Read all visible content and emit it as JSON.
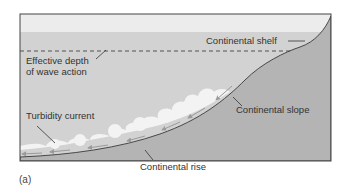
{
  "figure": {
    "caption": "(a)",
    "labels": {
      "continental_shelf": "Continental shelf",
      "effective_depth_line1": "Effective depth",
      "effective_depth_line2": "of wave action",
      "turbidity_current": "Turbidity current",
      "continental_slope": "Continental slope",
      "continental_rise": "Continental rise"
    },
    "colors": {
      "sky_band": "#ececec",
      "water": "#d2d2d2",
      "seafloor": "#b4b4b4",
      "frame": "#444444",
      "turbidity_cloud": "#f4f4f4",
      "arrows": "#9a9a9a"
    }
  }
}
